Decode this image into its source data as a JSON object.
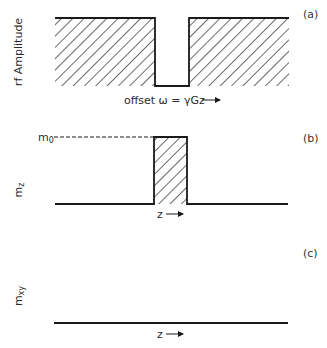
{
  "figure": {
    "panels": [
      {
        "id": "a",
        "panel_label": "(a)",
        "y_label": "rf Amplitude",
        "x_label": "offset ω = γGz",
        "x_arrow": "→",
        "description": "Hatched rf amplitude spectrum with a notch (zero amplitude) at the center"
      },
      {
        "id": "b",
        "panel_label": "(b)",
        "y_label_main": "m",
        "y_label_sub": "z",
        "level_label_main": "m",
        "level_label_sub": "0",
        "x_label": "z",
        "x_arrow": "→",
        "description": "Longitudinal magnetization: m0 only within narrow slice, zero elsewhere"
      },
      {
        "id": "c",
        "panel_label": "(c)",
        "y_label_main": "m",
        "y_label_sub": "xy",
        "x_label": "z",
        "x_arrow": "→",
        "description": "Transverse magnetization is zero everywhere"
      }
    ]
  },
  "colors": {
    "ink": "#1a1a1a",
    "background": "#ffffff"
  }
}
